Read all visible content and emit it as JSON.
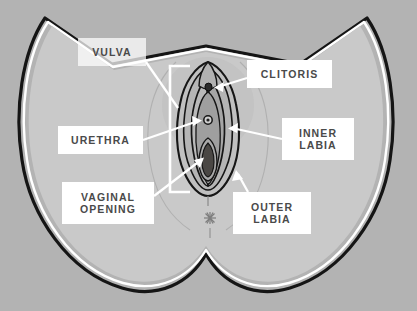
{
  "diagram": {
    "type": "anatomical-illustration",
    "background_color": "#b3b3b3",
    "body_color": "#c9c9c9",
    "outline_color": "#1a1a1a",
    "label_text_color": "#4a4a4a",
    "label_box_color": "#ffffff",
    "leader_line_color": "#ffffff"
  },
  "labels": [
    {
      "id": "vulva",
      "text": "VULVA",
      "x": 78,
      "y": 38,
      "w": 68,
      "h": 28,
      "style": "translucent"
    },
    {
      "id": "clitoris",
      "text": "CLITORIS",
      "x": 247,
      "y": 60,
      "w": 85,
      "h": 28,
      "style": "solid"
    },
    {
      "id": "urethra",
      "text": "URETHRA",
      "x": 58,
      "y": 126,
      "w": 85,
      "h": 28,
      "style": "solid"
    },
    {
      "id": "inner_labia",
      "text": "INNER\nLABIA",
      "x": 282,
      "y": 118,
      "w": 72,
      "h": 42,
      "style": "solid"
    },
    {
      "id": "vaginal_opening",
      "text": "VAGINAL\nOPENING",
      "x": 62,
      "y": 182,
      "w": 92,
      "h": 42,
      "style": "solid"
    },
    {
      "id": "outer_labia",
      "text": "OUTER\nLABIA",
      "x": 233,
      "y": 192,
      "w": 78,
      "h": 42,
      "style": "solid"
    }
  ],
  "anatomy_parts": [
    {
      "id": "vulva",
      "name": "Vulva",
      "marker": "bracket",
      "point_x": 176,
      "point_y": 128
    },
    {
      "id": "clitoris",
      "name": "Clitoris",
      "marker": "dot",
      "point_x": 210,
      "point_y": 88
    },
    {
      "id": "urethra",
      "name": "Urethra",
      "marker": "ring",
      "point_x": 205,
      "point_y": 120
    },
    {
      "id": "inner_labia",
      "name": "Inner labia",
      "marker": "arrow",
      "point_x": 228,
      "point_y": 128
    },
    {
      "id": "vaginal_opening",
      "name": "Vaginal opening",
      "marker": "opening",
      "point_x": 206,
      "point_y": 160
    },
    {
      "id": "outer_labia",
      "name": "Outer labia",
      "marker": "arrow",
      "point_x": 238,
      "point_y": 175
    },
    {
      "id": "anus",
      "name": "Anus",
      "marker": "starburst",
      "point_x": 210,
      "point_y": 218
    }
  ]
}
